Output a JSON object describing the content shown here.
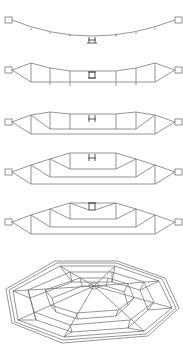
{
  "figure": {
    "colors": {
      "line": "#7a7a7a",
      "background": "#ffffff"
    },
    "stages": [
      {
        "id": 1,
        "name": "stage-1-cable-only"
      },
      {
        "id": 2,
        "name": "stage-2-lower-truss"
      },
      {
        "id": 3,
        "name": "stage-3-extended-truss"
      },
      {
        "id": 4,
        "name": "stage-4-raised-truss"
      },
      {
        "id": 5,
        "name": "stage-5-complete-truss"
      }
    ],
    "perspective": {
      "name": "octagonal-roof-perspective"
    }
  }
}
